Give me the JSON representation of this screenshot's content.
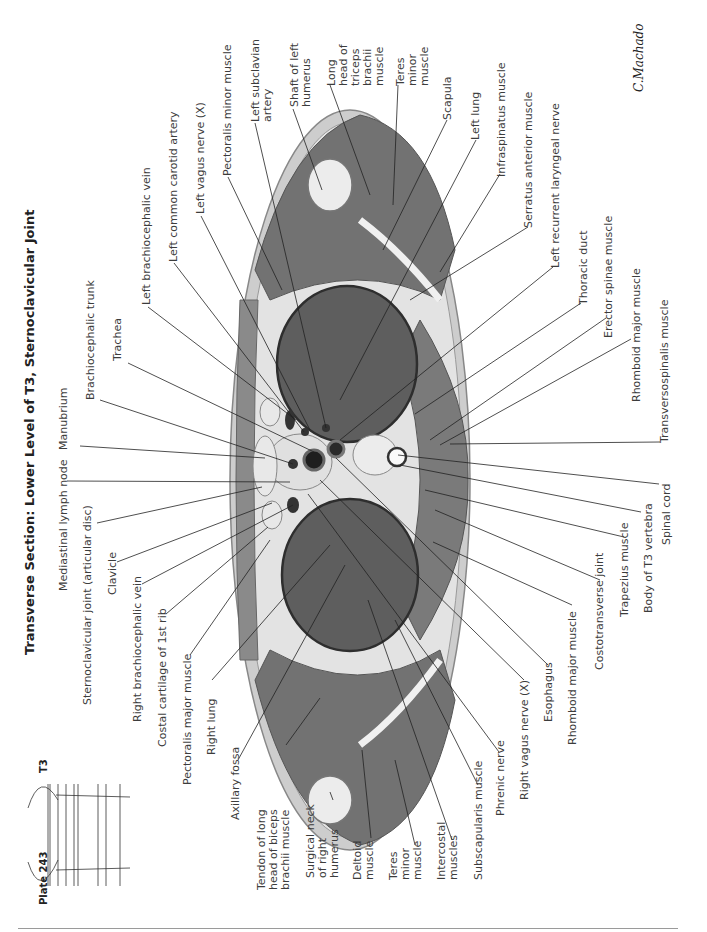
{
  "plate": {
    "number_label": "Plate 243",
    "title": "Transverse Section: Lower Level of T3, Sternoclavicular Joint",
    "level_marker": "T3",
    "signature": "C.Machado"
  },
  "labels_top": {
    "left_brachiocephalic_vein": "Left brachiocephalic vein",
    "left_common_carotid_artery": "Left common carotid artery",
    "left_vagus_nerve": "Left vagus nerve (X)",
    "pectoralis_minor_muscle": "Pectoralis minor muscle",
    "left_subclavian_artery": "Left subclavian\nartery",
    "shaft_of_left_humerus": "Shaft of left\nhumerus",
    "long_head_triceps": "Long\nhead of\ntriceps\nbrachii\nmuscle",
    "teres_minor_left": "Teres\nminor\nmuscle",
    "scapula": "Scapula",
    "left_lung": "Left lung",
    "infraspinatus_muscle": "Infraspinatus muscle",
    "serratus_anterior_muscle": "Serratus anterior muscle",
    "left_recurrent_laryngeal_nerve": "Left recurrent laryngeal nerve",
    "thoracic_duct": "Thoracic duct",
    "erector_spinae_muscle": "Erector spinae muscle",
    "rhomboid_major_muscle_left": "Rhomboid major muscle",
    "transversospinalis_muscle": "Transversospinalis muscle"
  },
  "labels_left": {
    "trachea": "Trachea",
    "brachiocephalic_trunk": "Brachiocephalic trunk",
    "manubrium": "Manubrium",
    "mediastinal_lymph_node": "Mediastinal lymph node",
    "sternoclavicular_joint": "Sternoclavicular joint (articular disc)",
    "clavicle": "Clavicle",
    "right_brachiocephalic_vein": "Right brachiocephalic vein",
    "costal_cartilage_1st_rib": "Costal cartilage of 1st rib",
    "pectoralis_major_muscle": "Pectoralis major muscle",
    "right_lung": "Right lung",
    "axillary_fossa": "Axillary fossa"
  },
  "labels_bottom": {
    "tendon_long_head_biceps": "Tendon of long\nhead of biceps\nbrachii muscle",
    "surgical_neck_right_humerus": "Surgical neck\nof right\nhumerus",
    "deltoid_muscle": "Deltoid\nmuscle",
    "teres_minor_right": "Teres\nminor\nmuscle",
    "intercostal_muscles": "Intercostal\nmuscles",
    "subscapularis_muscle": "Subscapularis muscle",
    "phrenic_nerve": "Phrenic nerve",
    "right_vagus_nerve": "Right vagus nerve (X)",
    "esophagus": "Esophagus",
    "rhomboid_major_muscle_right": "Rhomboid major muscle",
    "costotransverse_joint": "Costotransverse joint",
    "trapezius_muscle": "Trapezius muscle",
    "body_of_t3_vertebra": "Body of T3 vertebra",
    "spinal_cord": "Spinal cord"
  },
  "colors": {
    "muscle": "#6e6e6e",
    "lung": "#5a5a5a",
    "bone": "#e8e8e8",
    "fat": "#d9d9d9",
    "skin": "#cfcfcf",
    "leader_line": "#222222"
  }
}
